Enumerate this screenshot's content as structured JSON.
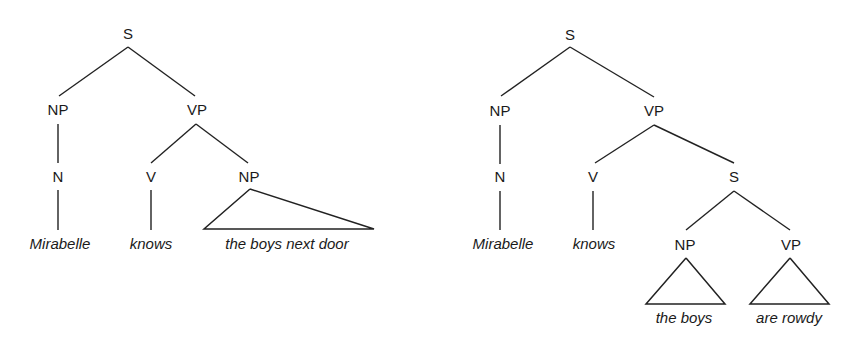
{
  "trees": [
    {
      "name": "left-tree",
      "nodes": {
        "root": "S",
        "np": "NP",
        "vp": "VP",
        "n": "N",
        "v": "V",
        "obj_np": "NP"
      },
      "words": {
        "mirabelle": "Mirabelle",
        "knows": "knows",
        "obj": "the boys next door"
      }
    },
    {
      "name": "right-tree",
      "nodes": {
        "root": "S",
        "np": "NP",
        "vp": "VP",
        "n": "N",
        "v": "V",
        "embedded_s": "S",
        "embedded_np": "NP",
        "embedded_vp": "VP"
      },
      "words": {
        "mirabelle": "Mirabelle",
        "knows": "knows",
        "subj": "the boys",
        "pred": "are rowdy"
      }
    }
  ]
}
